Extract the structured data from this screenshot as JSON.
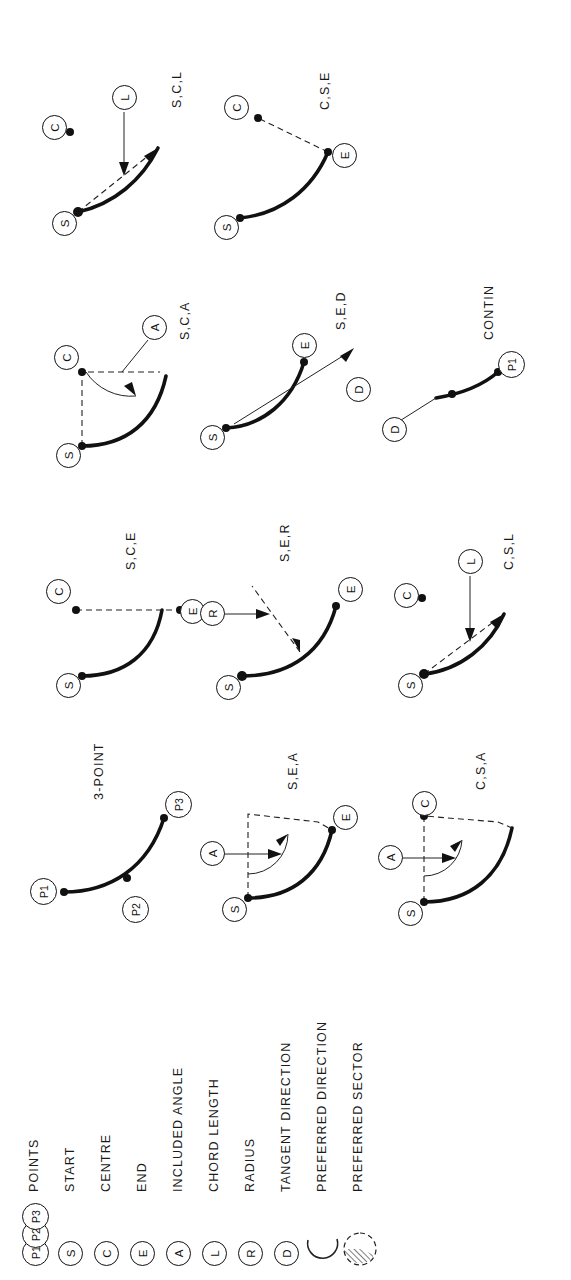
{
  "legend": {
    "rows": [
      {
        "symbols": [
          "P1",
          "P2",
          "P3"
        ],
        "label": "POINTS",
        "icon": "points-symbol"
      },
      {
        "symbols": [
          "S"
        ],
        "label": "START",
        "icon": "start-symbol"
      },
      {
        "symbols": [
          "C"
        ],
        "label": "CENTRE",
        "icon": "centre-symbol"
      },
      {
        "symbols": [
          "E"
        ],
        "label": "END",
        "icon": "end-symbol"
      },
      {
        "symbols": [
          "A"
        ],
        "label": "INCLUDED ANGLE",
        "icon": "included-angle-symbol"
      },
      {
        "symbols": [
          "L"
        ],
        "label": "CHORD LENGTH",
        "icon": "chord-length-symbol"
      },
      {
        "symbols": [
          "R"
        ],
        "label": "RADIUS",
        "icon": "radius-symbol"
      },
      {
        "symbols": [
          "D"
        ],
        "label": "TANGENT DIRECTION",
        "icon": "tangent-direction-symbol"
      },
      {
        "symbols": [],
        "label": "PREFERRED DIRECTION",
        "icon": "preferred-direction-arc-icon"
      },
      {
        "symbols": [],
        "label": "PREFERRED SECTOR",
        "icon": "preferred-sector-hatched-icon"
      }
    ]
  },
  "panels": {
    "three_point": {
      "caption": "3-POINT",
      "nodes": [
        "P1",
        "P2",
        "P3"
      ]
    },
    "s_e_a": {
      "caption": "S,E,A",
      "nodes": [
        "A",
        "S",
        "E"
      ]
    },
    "c_s_a": {
      "caption": "C,S,A",
      "nodes": [
        "A",
        "S",
        "C"
      ]
    },
    "s_c_e": {
      "caption": "S,C,E",
      "nodes": [
        "S",
        "C",
        "E"
      ]
    },
    "s_e_r": {
      "caption": "S,E,R",
      "nodes": [
        "R",
        "S",
        "E"
      ]
    },
    "c_s_l": {
      "caption": "C,S,L",
      "nodes": [
        "S",
        "C",
        "L"
      ]
    },
    "s_c_a": {
      "caption": "S,C,A",
      "nodes": [
        "S",
        "C",
        "A"
      ]
    },
    "s_e_d": {
      "caption": "S,E,D",
      "nodes": [
        "S",
        "E",
        "D"
      ]
    },
    "contin": {
      "caption": "CONTIN",
      "nodes": [
        "D",
        "P1"
      ]
    },
    "s_c_l": {
      "caption": "S,C,L",
      "nodes": [
        "S",
        "C",
        "L"
      ]
    },
    "c_s_e": {
      "caption": "C,S,E",
      "nodes": [
        "S",
        "C",
        "E"
      ]
    }
  },
  "colors": {
    "ink": "#111111",
    "paper": "#ffffff"
  }
}
